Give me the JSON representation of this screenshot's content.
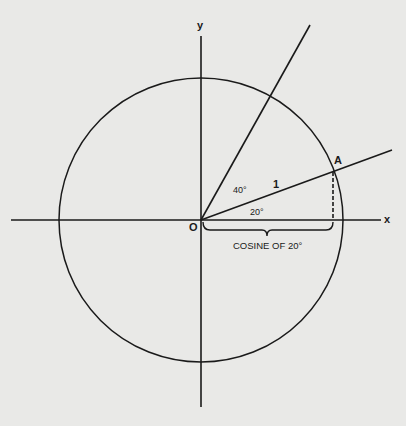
{
  "diagram": {
    "axes": {
      "x_label": "x",
      "y_label": "y",
      "origin_label": "O"
    },
    "circle": {
      "radius_label": "1"
    },
    "point": {
      "label": "A",
      "angle_deg": 20
    },
    "angles": {
      "small": "20°",
      "between": "40°",
      "second_line_deg": 60
    },
    "brace_label": "COSINE OF 20°",
    "colors": {
      "background": "#e9e9e7",
      "ink": "#1a1a1a"
    }
  }
}
